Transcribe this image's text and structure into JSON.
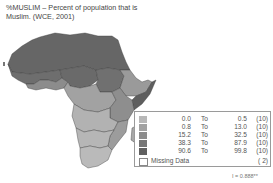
{
  "title": {
    "line1": "%MUSLIM – Percent of population that is",
    "line2": "Muslim. (WCE, 2001)"
  },
  "legend": {
    "classes": [
      {
        "low": "0.0",
        "to": "To",
        "high": "0.5",
        "count": "(10)",
        "color": "#b8b8b8"
      },
      {
        "low": "0.8",
        "to": "To",
        "high": "13.0",
        "count": "(10)",
        "color": "#a2a2a2"
      },
      {
        "low": "15.2",
        "to": "To",
        "high": "32.5",
        "count": "(10)",
        "color": "#8c8c8c"
      },
      {
        "low": "38.3",
        "to": "To",
        "high": "87.9",
        "count": "(10)",
        "color": "#767676"
      },
      {
        "low": "90.6",
        "to": "To",
        "high": "99.8",
        "count": "(10)",
        "color": "#606060"
      }
    ],
    "missing": {
      "label": "Missing Data",
      "count": "( 2)"
    }
  },
  "statistic": "I = 0.888**",
  "map": {
    "region": "Africa",
    "variable": "%MUSLIM",
    "colors": {
      "c1": "#b8b8b8",
      "c2": "#a2a2a2",
      "c3": "#8c8c8c",
      "c4": "#767676",
      "c5": "#606060",
      "border": "#3a3a3a"
    }
  }
}
